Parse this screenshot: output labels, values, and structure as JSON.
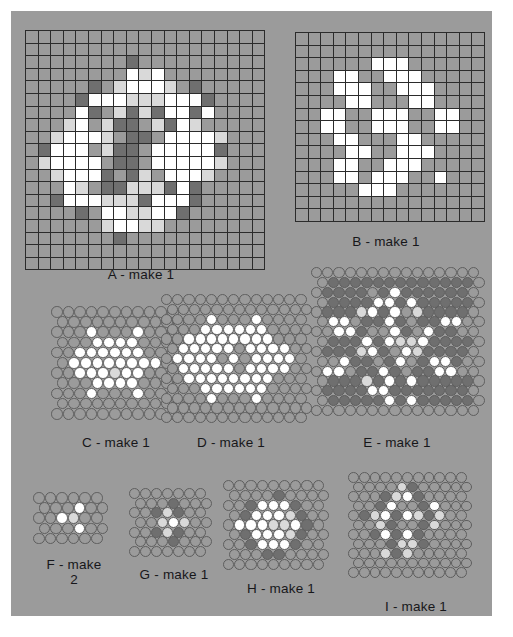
{
  "sheet": {
    "background_color": "#9b9b9b",
    "page_background": "#ffffff"
  },
  "palette": {
    "background_gray": "#9b9b9b",
    "grid_line": "#2b2b2b",
    "white": "#ffffff",
    "light_gray": "#d9d9d9",
    "mid_gray": "#9b9b9b",
    "dark_gray": "#6f6f6f",
    "darker_gray": "#5a5a5a",
    "bead_outline": "#5e5e5e",
    "text": "#17171a"
  },
  "patterns": [
    {
      "id": "A",
      "label": "A - make 1",
      "type": "square-grid",
      "cols": 19,
      "rows": 19,
      "legend": [
        "mid_gray",
        "white",
        "light_gray",
        "dark_gray"
      ],
      "cells": [
        "0000000000000000000",
        "0000000000000000000",
        "0000000030000000000",
        "0000000012100000000",
        "0000030211120300000",
        "0000311122211130000",
        "0000130232311310000",
        "0002102330231200000",
        "0021112033011112000",
        "0311102330111113000",
        "0211110330111112000",
        "0021113032011120000",
        "0001203322231300000",
        "0031112223111300000",
        "0000301122113000000",
        "0000002112200000000",
        "0000000300000000000",
        "0000000000000000000",
        "0000000000000000000"
      ]
    },
    {
      "id": "B",
      "label": "B - make 1",
      "type": "square-grid",
      "cols": 15,
      "rows": 15,
      "legend": [
        "mid_gray",
        "white"
      ],
      "cells": [
        "000000000000000",
        "000000000000000",
        "000000111000000",
        "000110011100000",
        "000111001110000",
        "000011000110000",
        "001100111001100",
        "001100111001100",
        "000110001100000",
        "000011001110000",
        "000110011100000",
        "000110111001000",
        "000001110000000",
        "000000000000000",
        "000000000000000"
      ]
    },
    {
      "id": "C",
      "label": "C - make 1",
      "type": "bead-grid",
      "cols": 11,
      "rows": 11,
      "legend": [
        "mid_gray",
        "white",
        "light_gray",
        "dark_gray"
      ],
      "cells": [
        "00000000000",
        "00000000000",
        "00010001000",
        "00011110000",
        "00111111000",
        "01111111100",
        "00111211000",
        "00011110000",
        "00010001000",
        "00000000000",
        "00000000000"
      ]
    },
    {
      "id": "D",
      "label": "D - make 1",
      "type": "bead-grid",
      "cols": 13,
      "rows": 13,
      "legend": [
        "mid_gray",
        "white",
        "light_gray",
        "dark_gray"
      ],
      "cells": [
        "0000000000000",
        "0000000000000",
        "0000100010000",
        "0001111110000",
        "0011111111000",
        "0111110111100",
        "0111101011110",
        "0111110111100",
        "0011111111000",
        "0001111110000",
        "0000100010000",
        "0000000000000",
        "0000000000000"
      ]
    },
    {
      "id": "E",
      "label": "E - make 1",
      "type": "bead-grid",
      "cols": 15,
      "rows": 15,
      "legend": [
        "mid_gray",
        "white",
        "light_gray",
        "dark_gray"
      ],
      "cells": [
        "000000000000000",
        "033333333333330",
        "033330313333330",
        "033331131333330",
        "033321310233330",
        "011033130331100",
        "001130013013300",
        "033313122133330",
        "033321301233330",
        "001330310311300",
        "011033130331100",
        "033323131333330",
        "033331133333330",
        "033333131333330",
        "000000000000000"
      ]
    },
    {
      "id": "F",
      "label": "F - make\n2",
      "type": "bead-grid",
      "cols": 6,
      "rows": 5,
      "legend": [
        "mid_gray",
        "white",
        "light_gray",
        "dark_gray"
      ],
      "cells": [
        "000000",
        "000100",
        "001200",
        "000100",
        "000000"
      ]
    },
    {
      "id": "G",
      "label": "G - make 1",
      "type": "bead-grid",
      "cols": 7,
      "rows": 7,
      "legend": [
        "mid_gray",
        "white",
        "light_gray",
        "dark_gray"
      ],
      "cells": [
        "0000000",
        "0003000",
        "0032300",
        "0021200",
        "0032300",
        "0003000",
        "0000000"
      ]
    },
    {
      "id": "H",
      "label": "H - make 1",
      "type": "bead-grid",
      "cols": 9,
      "rows": 9,
      "legend": [
        "mid_gray",
        "white",
        "light_gray",
        "dark_gray"
      ],
      "cells": [
        "000000000",
        "000030000",
        "003111300",
        "031112300",
        "011122130",
        "031112300",
        "003111300",
        "000330000",
        "000000000"
      ]
    },
    {
      "id": "I",
      "label": "I - make 1",
      "type": "bead-grid",
      "cols": 11,
      "rows": 11,
      "legend": [
        "mid_gray",
        "white",
        "light_gray",
        "dark_gray"
      ],
      "cells": [
        "00000000000",
        "00002300000",
        "00032130000",
        "00310031000",
        "03213123200",
        "00230032000",
        "00313130000",
        "00032230000",
        "00023200000",
        "00000000000",
        "00000000000"
      ]
    }
  ],
  "layout": {
    "A": {
      "x": 14,
      "y": 19,
      "cell": 11.6,
      "label_x": 14,
      "label_y": 256,
      "label_w": 232
    },
    "B": {
      "x": 284,
      "y": 21,
      "cell": 11.6,
      "label_x": 284,
      "label_y": 223,
      "label_w": 182
    },
    "C": {
      "x": 40,
      "y": 295,
      "bead": 11.6,
      "label_x": 30,
      "label_y": 424,
      "label_w": 150
    },
    "D": {
      "x": 150,
      "y": 283,
      "bead": 11.2,
      "label_x": 140,
      "label_y": 424,
      "label_w": 160
    },
    "E": {
      "x": 300,
      "y": 256,
      "bead": 11.2,
      "label_x": 300,
      "label_y": 424,
      "label_w": 172
    },
    "F": {
      "x": 22,
      "y": 481,
      "bead": 11.6,
      "label_x": 8,
      "label_y": 546,
      "label_w": 110
    },
    "G": {
      "x": 118,
      "y": 477,
      "bead": 11.0,
      "label_x": 98,
      "label_y": 556,
      "label_w": 130
    },
    "H": {
      "x": 212,
      "y": 469,
      "bead": 11.2,
      "label_x": 200,
      "label_y": 570,
      "label_w": 140
    },
    "I": {
      "x": 337,
      "y": 461,
      "bead": 10.8,
      "label_x": 330,
      "label_y": 588,
      "label_w": 150
    }
  }
}
